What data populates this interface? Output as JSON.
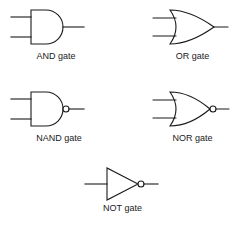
{
  "diagram": {
    "background_color": "#ffffff",
    "stroke_color": "#1a1a1a",
    "text_color": "#1a1a1a",
    "gates": [
      {
        "id": "and",
        "label": "AND gate",
        "symbol_shape": "d-shape-body",
        "inputs": 2,
        "outputs": 1,
        "inverted_output": false,
        "label_x": 56,
        "label_y": 56
      },
      {
        "id": "or",
        "label": "OR gate",
        "symbol_shape": "curved-shield-body",
        "inputs": 2,
        "outputs": 1,
        "inverted_output": false,
        "label_x": 192,
        "label_y": 56
      },
      {
        "id": "nand",
        "label": "NAND gate",
        "symbol_shape": "d-shape-body-with-bubble",
        "inputs": 2,
        "outputs": 1,
        "inverted_output": true,
        "label_x": 56,
        "label_y": 138
      },
      {
        "id": "nor",
        "label": "NOR gate",
        "symbol_shape": "curved-shield-body-with-bubble",
        "inputs": 2,
        "outputs": 1,
        "inverted_output": true,
        "label_x": 192,
        "label_y": 138
      },
      {
        "id": "not",
        "label": "NOT gate",
        "symbol_shape": "triangle-with-bubble",
        "inputs": 1,
        "outputs": 1,
        "inverted_output": true,
        "label_x": 122,
        "label_y": 208
      }
    ]
  }
}
